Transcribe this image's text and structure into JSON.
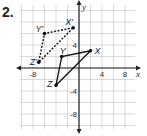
{
  "problem_number": "2.",
  "chart_data": {
    "type": "scatter",
    "title": "",
    "xlabel": "x",
    "ylabel": "y",
    "xlim": [
      -10,
      10
    ],
    "ylim": [
      -10.5,
      11
    ],
    "grid": true,
    "grid_step": 2,
    "x_tick_labels": [
      "-8",
      "4",
      "8"
    ],
    "y_tick_labels": [
      "4",
      "-4",
      "-8"
    ],
    "series": [
      {
        "name": "XYZ (preimage)",
        "style": "solid",
        "points": [
          {
            "label": "X",
            "x": 2,
            "y": 3
          },
          {
            "label": "Y",
            "x": -3,
            "y": 2
          },
          {
            "label": "Z",
            "x": -4,
            "y": -3
          }
        ]
      },
      {
        "name": "X'Y'Z' (image)",
        "style": "dashed",
        "points": [
          {
            "label": "X'",
            "x": -1,
            "y": 7
          },
          {
            "label": "Y'",
            "x": -6,
            "y": 6
          },
          {
            "label": "Z'",
            "x": -7,
            "y": 1
          }
        ]
      }
    ]
  }
}
